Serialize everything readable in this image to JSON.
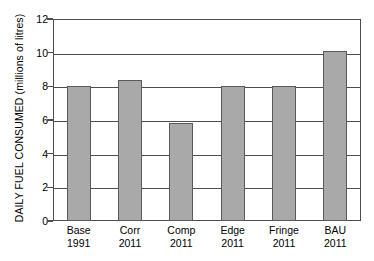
{
  "chart_data": {
    "type": "bar",
    "title": "",
    "xlabel": "",
    "ylabel": "DAILY FUEL CONSUMED (millions of litres)",
    "categories": [
      "Base 1991",
      "Corr 2011",
      "Comp 2011",
      "Edge 2011",
      "Fringe 2011",
      "BAU 2011"
    ],
    "category_lines": [
      {
        "line1": "Base",
        "line2": "1991"
      },
      {
        "line1": "Corr",
        "line2": "2011"
      },
      {
        "line1": "Comp",
        "line2": "2011"
      },
      {
        "line1": "Edge",
        "line2": "2011"
      },
      {
        "line1": "Fringe",
        "line2": "2011"
      },
      {
        "line1": "BAU",
        "line2": "2011"
      }
    ],
    "values": [
      8.0,
      8.4,
      5.85,
      8.0,
      8.0,
      10.1
    ],
    "ylim": [
      0,
      12
    ],
    "yticks": [
      0,
      2,
      4,
      6,
      8,
      10,
      12
    ],
    "ytick_labels": [
      "0",
      "2",
      "4",
      "6",
      "8",
      "10",
      "12"
    ],
    "grid": true,
    "grid_axis": "y",
    "legend": null,
    "bar_color": "#a9a9a9",
    "bar_border_color": "#5a5a5a",
    "axis_color": "#4d4d4d",
    "background_color": "#ffffff"
  }
}
